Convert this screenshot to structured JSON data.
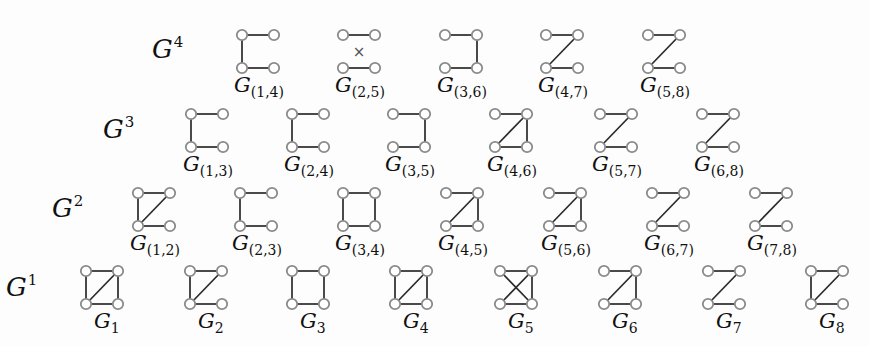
{
  "figure": {
    "node_offsets": {
      "w": 32,
      "h": 33
    },
    "rows": [
      {
        "label": "G",
        "sup": "4",
        "label_x": 152,
        "label_y": 58,
        "top_y": 35,
        "graphs": [
          {
            "name": "G",
            "sub": "(1,4)",
            "x": 242,
            "edges": [
              "top",
              "left",
              "bottom"
            ]
          },
          {
            "name": "G",
            "sub": "(2,5)",
            "x": 343,
            "edges": [
              "top",
              "bottom"
            ],
            "marker": "×"
          },
          {
            "name": "G",
            "sub": "(3,6)",
            "x": 445,
            "edges": [
              "top",
              "right",
              "bottom"
            ]
          },
          {
            "name": "G",
            "sub": "(4,7)",
            "x": 546,
            "edges": [
              "top",
              "diag",
              "bottom"
            ]
          },
          {
            "name": "G",
            "sub": "(5,8)",
            "x": 648,
            "edges": [
              "top",
              "diag",
              "bottom"
            ]
          }
        ]
      },
      {
        "label": "G",
        "sup": "3",
        "label_x": 103,
        "label_y": 138,
        "top_y": 114,
        "graphs": [
          {
            "name": "G",
            "sub": "(1,3)",
            "x": 191,
            "edges": [
              "top",
              "left",
              "bottom"
            ]
          },
          {
            "name": "G",
            "sub": "(2,4)",
            "x": 292,
            "edges": [
              "top",
              "left",
              "bottom"
            ]
          },
          {
            "name": "G",
            "sub": "(3,5)",
            "x": 393,
            "edges": [
              "top",
              "right",
              "bottom"
            ]
          },
          {
            "name": "G",
            "sub": "(4,6)",
            "x": 495,
            "edges": [
              "top",
              "right",
              "diag",
              "bottom"
            ]
          },
          {
            "name": "G",
            "sub": "(5,7)",
            "x": 600,
            "edges": [
              "top",
              "diag",
              "bottom"
            ]
          },
          {
            "name": "G",
            "sub": "(6,8)",
            "x": 702,
            "edges": [
              "top",
              "diag",
              "bottom"
            ]
          }
        ]
      },
      {
        "label": "G",
        "sup": "2",
        "label_x": 52,
        "label_y": 217,
        "top_y": 193,
        "graphs": [
          {
            "name": "G",
            "sub": "(1,2)",
            "x": 138,
            "edges": [
              "top",
              "left",
              "diag",
              "bottom"
            ]
          },
          {
            "name": "G",
            "sub": "(2,3)",
            "x": 240,
            "edges": [
              "top",
              "left",
              "bottom"
            ]
          },
          {
            "name": "G",
            "sub": "(3,4)",
            "x": 343,
            "edges": [
              "top",
              "left",
              "right",
              "bottom"
            ]
          },
          {
            "name": "G",
            "sub": "(4,5)",
            "x": 446,
            "edges": [
              "top",
              "right",
              "diag",
              "bottom"
            ]
          },
          {
            "name": "G",
            "sub": "(5,6)",
            "x": 549,
            "edges": [
              "top",
              "right",
              "diag",
              "bottom"
            ]
          },
          {
            "name": "G",
            "sub": "(6,7)",
            "x": 652,
            "edges": [
              "top",
              "diag",
              "bottom"
            ]
          },
          {
            "name": "G",
            "sub": "(7,8)",
            "x": 755,
            "edges": [
              "top",
              "diag",
              "bottom"
            ]
          }
        ]
      },
      {
        "label": "G",
        "sup": "1",
        "label_x": 6,
        "label_y": 296,
        "top_y": 271,
        "graphs": [
          {
            "name": "G",
            "sub": "1",
            "x": 86,
            "edges": [
              "top",
              "left",
              "right",
              "diag",
              "bottom"
            ]
          },
          {
            "name": "G",
            "sub": "2",
            "x": 190,
            "edges": [
              "top",
              "left",
              "diag",
              "bottom"
            ]
          },
          {
            "name": "G",
            "sub": "3",
            "x": 292,
            "edges": [
              "top",
              "left",
              "right",
              "bottom"
            ]
          },
          {
            "name": "G",
            "sub": "4",
            "x": 395,
            "edges": [
              "top",
              "left",
              "right",
              "diag",
              "bottom"
            ]
          },
          {
            "name": "G",
            "sub": "5",
            "x": 500,
            "edges": [
              "top",
              "right",
              "diag",
              "antidiag",
              "bottom"
            ]
          },
          {
            "name": "G",
            "sub": "6",
            "x": 604,
            "edges": [
              "top",
              "right",
              "diag",
              "bottom"
            ]
          },
          {
            "name": "G",
            "sub": "7",
            "x": 708,
            "edges": [
              "top",
              "diag",
              "bottom"
            ]
          },
          {
            "name": "G",
            "sub": "8",
            "x": 811,
            "edges": [
              "top",
              "left",
              "diag",
              "bottom"
            ]
          }
        ]
      }
    ]
  }
}
